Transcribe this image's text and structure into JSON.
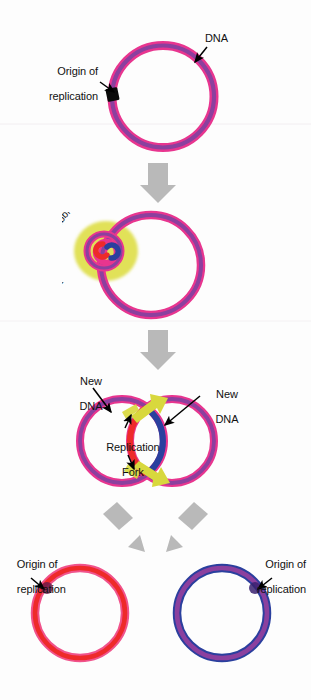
{
  "figure": {
    "background_color": "#fdfdfd"
  },
  "palette": {
    "parent_outer_pink": "#e8368f",
    "parent_inner_purple": "#8b3f9e",
    "new_dna_red": "#ee2b2b",
    "new_dna_blue": "#2b3f9e",
    "bubble_yellow": "#dede4a",
    "fork_arrow_yellow": "#d8d83c",
    "process_arrow_gray": "#b9b9b9",
    "origin_black": "#000000",
    "label_text": "#111111"
  },
  "stages": [
    {
      "id": "stage-1",
      "name": "parent-chromosome",
      "labels": [
        {
          "id": "origin-1",
          "text": "Origin of\nreplication",
          "align": "right"
        },
        {
          "id": "dna-1",
          "text": "DNA",
          "align": "left"
        }
      ]
    },
    {
      "id": "stage-2",
      "name": "replication-bubble-stage",
      "labels": [
        {
          "id": "replication-bubble",
          "text": "Replication bubble",
          "align": "arc"
        }
      ]
    },
    {
      "id": "stage-3",
      "name": "theta-structure-stage",
      "labels": [
        {
          "id": "new-dna-left",
          "text": "New\nDNA",
          "align": "center"
        },
        {
          "id": "new-dna-right",
          "text": "New\nDNA",
          "align": "center"
        },
        {
          "id": "replication-fork",
          "text": "Replication\nFork",
          "align": "center"
        }
      ]
    },
    {
      "id": "stage-4",
      "name": "daughter-chromosomes",
      "labels": [
        {
          "id": "origin-left",
          "text": "Origin of\nreplication",
          "align": "left"
        },
        {
          "id": "origin-right",
          "text": "Origin of\nreplication",
          "align": "right"
        }
      ]
    }
  ],
  "text": {
    "origin_of_replication_line1": "Origin of",
    "origin_of_replication_line2": "replication",
    "dna": "DNA",
    "replication_bubble": "Replication bubble",
    "new_line1": "New",
    "new_line2": "DNA",
    "replication_fork_line1": "Replication",
    "replication_fork_line2": "Fork"
  },
  "process_arrows": [
    {
      "id": "arrow-1-to-2",
      "direction": "down"
    },
    {
      "id": "arrow-2-to-3",
      "direction": "down"
    },
    {
      "id": "arrow-3-to-4-left",
      "direction": "down-left"
    },
    {
      "id": "arrow-3-to-4-right",
      "direction": "down-right"
    }
  ]
}
